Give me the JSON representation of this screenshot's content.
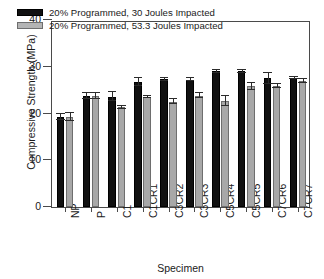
{
  "chart_data": {
    "type": "bar",
    "title": "",
    "xlabel": "Specimen",
    "ylabel": "Compressive Strength (MPa)",
    "categories": [
      "NP",
      "P",
      "C1",
      "C1CR1",
      "C3CR2",
      "C3CR3",
      "C5CR4",
      "C5CR5",
      "C7CR6",
      "C7CR7"
    ],
    "ylim": [
      0,
      40
    ],
    "yticks": [
      0,
      10,
      20,
      30,
      40
    ],
    "ytick_labels": [
      "0",
      "10",
      "20",
      "30",
      "40"
    ],
    "grid": false,
    "legend_position": "upper-left-inside",
    "series": [
      {
        "name": "20% Programmed, 30 Joules Impacted",
        "color": "#111111",
        "values": [
          19.3,
          23.8,
          23.6,
          26.8,
          27.3,
          27.2,
          29.0,
          29.0,
          27.5,
          27.6
        ],
        "errors": [
          0.7,
          0.6,
          1.0,
          0.9,
          0.4,
          0.3,
          0.3,
          0.3,
          1.2,
          0.3
        ]
      },
      {
        "name": "20% Programmed, 53.3 Joules  Impacted",
        "color": "#a8a8a8",
        "values": [
          19.3,
          23.8,
          21.3,
          23.6,
          22.5,
          23.8,
          22.7,
          25.8,
          25.9,
          27.0
        ],
        "errors": [
          0.8,
          0.6,
          0.3,
          0.2,
          0.5,
          0.5,
          1.0,
          0.7,
          0.4,
          0.4
        ]
      }
    ]
  },
  "legend": {
    "entries": [
      {
        "label": "20% Programmed, 30 Joules Impacted",
        "swatch": "dark"
      },
      {
        "label": "20% Programmed, 53.3 Joules  Impacted",
        "swatch": "light"
      }
    ]
  },
  "axes": {
    "y_title": "Compressive Strength (MPa)",
    "x_title": "Specimen"
  }
}
